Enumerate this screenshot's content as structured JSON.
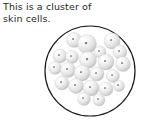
{
  "figure": {
    "caption_text": "This is a cluster of\nskin cells.",
    "caption_line_1": "This is a cluster of",
    "caption_line_2": "skin cells.",
    "subject": "skin cells",
    "background_color": "#ffffff",
    "text_color": "#231f20"
  },
  "diagram": {
    "title": "cluster of skin cells",
    "type": "biological-illustration",
    "boundary": {
      "shape": "circle",
      "label": "field-of-view circle",
      "center_x": 90,
      "center_y": 71,
      "radius": 45,
      "stroke_color": "#1a1a1a",
      "stroke_width": 1.2,
      "fill_color": "#ffffff"
    },
    "cell_style": {
      "body_color_light": "#ffffff",
      "body_color_mid": "#e6e6e6",
      "body_color_dark": "#b9b9b9",
      "outline_color": "#c9c9c9",
      "nucleus_color": "#8a8a8a",
      "highlight_color": "#ffffff"
    },
    "cell_count": 22,
    "cells": [
      {
        "id": "cell-1",
        "cx": 74,
        "cy": 40,
        "r": 7.5,
        "nx": 73,
        "ny": 39
      },
      {
        "id": "cell-2",
        "cx": 87,
        "cy": 44,
        "r": 9.5,
        "nx": 86,
        "ny": 43
      },
      {
        "id": "cell-3",
        "cx": 112,
        "cy": 41,
        "r": 8.0,
        "nx": 111,
        "ny": 40
      },
      {
        "id": "cell-4",
        "cx": 100,
        "cy": 52,
        "r": 6.0,
        "nx": 99,
        "ny": 51
      },
      {
        "id": "cell-5",
        "cx": 120,
        "cy": 52,
        "r": 7.0,
        "nx": 119,
        "ny": 51
      },
      {
        "id": "cell-6",
        "cx": 60,
        "cy": 56,
        "r": 7.0,
        "nx": 59,
        "ny": 55
      },
      {
        "id": "cell-7",
        "cx": 72,
        "cy": 57,
        "r": 6.5,
        "nx": 71,
        "ny": 56
      },
      {
        "id": "cell-8",
        "cx": 88,
        "cy": 60,
        "r": 8.5,
        "nx": 87,
        "ny": 59
      },
      {
        "id": "cell-9",
        "cx": 106,
        "cy": 62,
        "r": 8.0,
        "nx": 105,
        "ny": 61
      },
      {
        "id": "cell-10",
        "cx": 123,
        "cy": 64,
        "r": 7.5,
        "nx": 122,
        "ny": 63
      },
      {
        "id": "cell-11",
        "cx": 55,
        "cy": 68,
        "r": 6.5,
        "nx": 54,
        "ny": 67
      },
      {
        "id": "cell-12",
        "cx": 68,
        "cy": 70,
        "r": 7.5,
        "nx": 67,
        "ny": 69
      },
      {
        "id": "cell-13",
        "cx": 82,
        "cy": 73,
        "r": 8.0,
        "nx": 81,
        "ny": 72
      },
      {
        "id": "cell-14",
        "cx": 97,
        "cy": 74,
        "r": 7.0,
        "nx": 96,
        "ny": 73
      },
      {
        "id": "cell-15",
        "cx": 113,
        "cy": 76,
        "r": 6.5,
        "nx": 112,
        "ny": 75
      },
      {
        "id": "cell-16",
        "cx": 62,
        "cy": 83,
        "r": 7.0,
        "nx": 61,
        "ny": 82
      },
      {
        "id": "cell-17",
        "cx": 76,
        "cy": 86,
        "r": 7.5,
        "nx": 75,
        "ny": 85
      },
      {
        "id": "cell-18",
        "cx": 91,
        "cy": 88,
        "r": 8.0,
        "nx": 90,
        "ny": 87
      },
      {
        "id": "cell-19",
        "cx": 106,
        "cy": 89,
        "r": 7.0,
        "nx": 105,
        "ny": 88
      },
      {
        "id": "cell-20",
        "cx": 119,
        "cy": 86,
        "r": 5.5,
        "nx": 118,
        "ny": 85
      },
      {
        "id": "cell-21",
        "cx": 84,
        "cy": 99,
        "r": 6.5,
        "nx": 83,
        "ny": 98
      },
      {
        "id": "cell-22",
        "cx": 99,
        "cy": 100,
        "r": 6.0,
        "nx": 98,
        "ny": 99
      }
    ]
  }
}
